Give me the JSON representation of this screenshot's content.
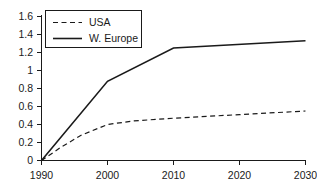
{
  "chart_data": {
    "type": "line",
    "title": "",
    "subtitle": "",
    "xlabel": "",
    "ylabel": "",
    "x": [
      1990,
      2000,
      2010,
      2020,
      2030
    ],
    "xlim": [
      1990,
      2030
    ],
    "ylim": [
      0,
      1.6
    ],
    "xticks": [
      "1990",
      "2000",
      "2010",
      "2020",
      "2030"
    ],
    "yticks": [
      "0",
      "0.2",
      "0.4",
      "0.6",
      "0.8",
      "1",
      "1.2",
      "1.4",
      "1.6"
    ],
    "ytick_values": [
      0,
      0.2,
      0.4,
      0.6,
      0.8,
      1.0,
      1.2,
      1.4,
      1.6
    ],
    "grid": false,
    "legend_position": "top-left",
    "series": [
      {
        "name": "USA",
        "style": "dashed",
        "color": "#1a1a1a",
        "values": [
          0,
          0.4,
          0.47,
          0.51,
          0.55
        ],
        "points": [
          {
            "x": 1990,
            "y": 0.0
          },
          {
            "x": 1993,
            "y": 0.15
          },
          {
            "x": 1996,
            "y": 0.28
          },
          {
            "x": 2000,
            "y": 0.4
          },
          {
            "x": 2004,
            "y": 0.44
          },
          {
            "x": 2010,
            "y": 0.47
          },
          {
            "x": 2020,
            "y": 0.51
          },
          {
            "x": 2030,
            "y": 0.55
          }
        ]
      },
      {
        "name": "W. Europe",
        "style": "solid",
        "color": "#1a1a1a",
        "values": [
          0,
          0.88,
          1.25,
          1.29,
          1.33
        ],
        "points": [
          {
            "x": 1990,
            "y": 0.0
          },
          {
            "x": 2000,
            "y": 0.88
          },
          {
            "x": 2010,
            "y": 1.25
          },
          {
            "x": 2030,
            "y": 1.33
          }
        ]
      }
    ]
  },
  "axis": {
    "y_tick_0": "0",
    "y_tick_1": "0.2",
    "y_tick_2": "0.4",
    "y_tick_3": "0.6",
    "y_tick_4": "0.8",
    "y_tick_5": "1",
    "y_tick_6": "1.2",
    "y_tick_7": "1.4",
    "y_tick_8": "1.6",
    "x_tick_0": "1990",
    "x_tick_1": "2000",
    "x_tick_2": "2010",
    "x_tick_3": "2020",
    "x_tick_4": "2030"
  },
  "legend": {
    "entry_usa": "USA",
    "entry_weurope": "W. Europe"
  },
  "colors": {
    "line": "#1a1a1a",
    "axis": "#1a1a1a",
    "background": "#ffffff"
  }
}
